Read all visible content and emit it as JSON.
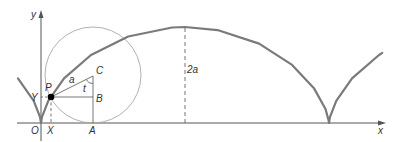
{
  "figure": {
    "colors": {
      "curve": "#7a7a7a",
      "circle": "#a8a8a8",
      "axes": "#555555",
      "lines": "#666666",
      "point": "#000000",
      "text": "#333333"
    },
    "axes": {
      "x_label": "x",
      "y_label": "y",
      "origin_label": "O"
    },
    "points": {
      "P": "P",
      "C": "C",
      "B": "B",
      "A": "A",
      "X": "X",
      "Y": "Y"
    },
    "annotations": {
      "radius": "a",
      "angle": "t",
      "height": "2a"
    }
  }
}
